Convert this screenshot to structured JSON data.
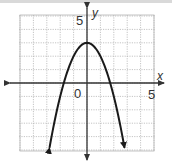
{
  "chart_data": {
    "type": "line",
    "title": "",
    "function": "y = 3 - x^2",
    "xlabel": "x",
    "ylabel": "y",
    "xlim": [
      -5,
      5
    ],
    "ylim": [
      -5,
      5
    ],
    "grid": true,
    "tick_labels": {
      "origin": "0",
      "x_max": "5",
      "y_max": "5"
    },
    "series": [
      {
        "name": "parabola",
        "x": [
          -2.8,
          -2.5,
          -2,
          -1.732,
          -1.5,
          -1,
          -0.5,
          0,
          0.5,
          1,
          1.5,
          1.732,
          2,
          2.5,
          2.8
        ],
        "y": [
          -4.84,
          -3.25,
          -1,
          0,
          0.75,
          2,
          2.75,
          3,
          2.75,
          2,
          0.75,
          0,
          -1,
          -3.25,
          -4.84
        ]
      }
    ],
    "annotations": {
      "vertex": [
        0,
        3
      ],
      "x_intercepts": [
        -1.73,
        1.73
      ],
      "ends_with_arrows": true
    }
  },
  "colors": {
    "curve": "#1a1a1a",
    "axis": "#333333",
    "grid": "#b5b5b5"
  }
}
